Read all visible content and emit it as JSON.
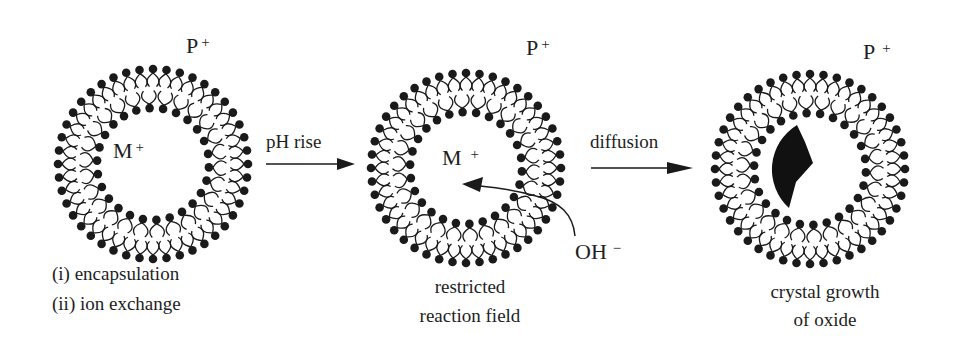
{
  "figure": {
    "colors": {
      "ink": "#1a1a1a",
      "background": "#ffffff"
    }
  },
  "stages": [
    {
      "id": "stage1",
      "outer_ion": {
        "symbol": "P",
        "charge": "+"
      },
      "inner_ion": {
        "symbol": "M",
        "charge": "+"
      },
      "caption_lines": [
        "(i) encapsulation",
        "(ii) ion exchange"
      ]
    },
    {
      "id": "stage2",
      "outer_ion": {
        "symbol": "P",
        "charge": "+"
      },
      "inner_ion": {
        "symbol": "M",
        "charge": "+"
      },
      "reagent": {
        "symbol": "OH",
        "charge": "−"
      },
      "caption_lines": [
        "restricted",
        "reaction field"
      ]
    },
    {
      "id": "stage3",
      "outer_ion": {
        "symbol": "P",
        "charge": "+"
      },
      "caption_lines": [
        "crystal growth",
        "of oxide"
      ]
    }
  ],
  "arrows": [
    {
      "label": "pH rise"
    },
    {
      "label": "diffusion"
    }
  ]
}
